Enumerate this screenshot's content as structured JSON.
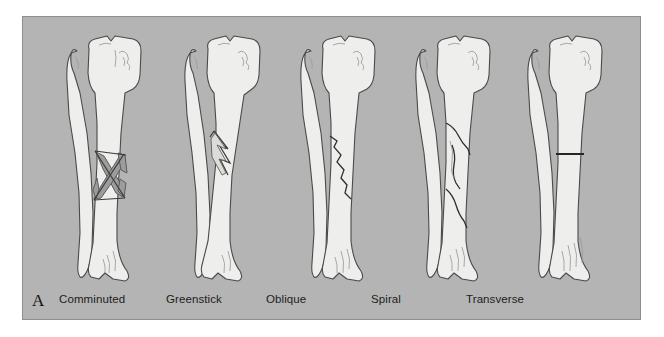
{
  "figure": {
    "panel_letter": "A",
    "background_color": "#b4b4b4",
    "page_color": "#ffffff",
    "bone_fill_color": "#eeeeec",
    "bone_outline_color": "#4a4a4a",
    "fracture_line_color": "#2a2a2a",
    "fragment_fill_color": "#9c9c9c"
  },
  "specimens": [
    {
      "id": "comminuted",
      "label": "Comminuted",
      "label_x": 36,
      "panel_x": 24,
      "description": "Tibia and fibula with mid-shaft bone broken into multiple crossing fragments forming an X pattern"
    },
    {
      "id": "greenstick",
      "label": "Greenstick",
      "label_x": 143,
      "panel_x": 143,
      "description": "Bowed tibia with incomplete fracture splitting only one cortex of the shaft"
    },
    {
      "id": "oblique",
      "label": "Oblique",
      "label_x": 243,
      "panel_x": 258,
      "description": "Tibia with a single angled fracture line running diagonally across the shaft"
    },
    {
      "id": "spiral",
      "label": "Spiral",
      "label_x": 348,
      "panel_x": 373,
      "description": "Tibia with long helical fracture line twisting around the shaft in two segments"
    },
    {
      "id": "transverse",
      "label": "Transverse",
      "label_x": 443,
      "panel_x": 485,
      "description": "Tibia with a clean horizontal fracture line perpendicular to the shaft"
    }
  ]
}
